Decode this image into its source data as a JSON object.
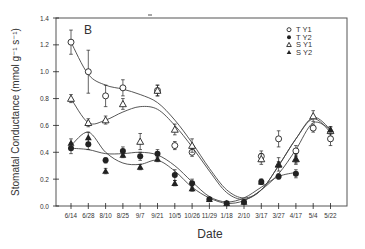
{
  "chart_data": {
    "type": "scatter",
    "panel_label": "B",
    "title": "",
    "xlabel": "Date",
    "ylabel": "Stomatal Conductance (mmol g⁻¹ s⁻¹)",
    "ylim": [
      0.0,
      1.4
    ],
    "yticks": [
      "0.0",
      "0.2",
      "0.4",
      "0.6",
      "0.8",
      "1.0",
      "1.2",
      "1.4"
    ],
    "categories": [
      "6/14",
      "6/28",
      "8/10",
      "8/25",
      "9/7",
      "9/21",
      "10/5",
      "10/26",
      "11/29",
      "1/18",
      "2/10",
      "3/17",
      "3/27",
      "4/17",
      "5/4",
      "5/22"
    ],
    "grid": false,
    "legend_position": "upper right",
    "series": [
      {
        "name": "T Y1",
        "marker": "open-circle",
        "values": [
          1.22,
          1.0,
          0.82,
          0.88,
          null,
          0.86,
          0.45,
          0.4,
          null,
          null,
          null,
          0.37,
          0.5,
          0.41,
          0.58,
          0.5
        ],
        "err": [
          0.09,
          0.16,
          0.08,
          0.06,
          null,
          0.04,
          0.03,
          0.03,
          null,
          null,
          null,
          0.04,
          0.06,
          0.04,
          0.03,
          0.05
        ]
      },
      {
        "name": "T Y2",
        "marker": "filled-circle",
        "values": [
          0.43,
          0.46,
          0.34,
          0.41,
          0.37,
          0.39,
          0.23,
          0.17,
          0.05,
          0.02,
          0.03,
          0.18,
          0.22,
          0.24,
          null,
          null
        ],
        "err": [
          0.04,
          0.04,
          0.02,
          0.03,
          0.03,
          0.03,
          0.04,
          0.03,
          0.01,
          0.01,
          0.01,
          0.02,
          0.02,
          0.03,
          null,
          null
        ]
      },
      {
        "name": "S Y1",
        "marker": "open-triangle",
        "values": [
          0.8,
          0.62,
          0.64,
          0.76,
          0.48,
          0.86,
          0.57,
          0.45,
          null,
          null,
          null,
          0.35,
          0.31,
          0.35,
          0.67,
          0.56
        ],
        "err": [
          0.03,
          0.03,
          0.03,
          0.04,
          0.06,
          0.04,
          0.04,
          0.05,
          null,
          null,
          null,
          0.04,
          0.05,
          0.04,
          0.04,
          0.03
        ]
      },
      {
        "name": "S Y2",
        "marker": "filled-triangle",
        "values": [
          0.47,
          0.51,
          0.26,
          0.38,
          0.29,
          0.35,
          0.17,
          0.13,
          0.05,
          0.02,
          0.03,
          0.18,
          0.31,
          0.35,
          null,
          0.57
        ],
        "err": [
          0.03,
          0.04,
          0.02,
          0.02,
          0.02,
          0.02,
          0.02,
          0.02,
          0.01,
          0.01,
          0.01,
          0.02,
          0.02,
          0.03,
          null,
          0.02
        ]
      }
    ],
    "fit_curves": [
      {
        "name": "T Y1 fit",
        "values": [
          1.22,
          0.98,
          0.9,
          0.87,
          0.83,
          0.77,
          0.64,
          0.47,
          0.28,
          0.12,
          0.06,
          0.12,
          0.3,
          0.5,
          0.65,
          0.55
        ]
      },
      {
        "name": "S Y1 fit",
        "values": [
          0.8,
          0.62,
          0.64,
          0.7,
          0.74,
          0.72,
          0.6,
          0.44,
          0.26,
          0.1,
          0.05,
          0.12,
          0.3,
          0.5,
          0.66,
          0.57
        ]
      },
      {
        "name": "T Y2 fit",
        "values": [
          0.43,
          0.42,
          0.39,
          0.39,
          0.4,
          0.38,
          0.3,
          0.18,
          0.07,
          0.03,
          0.06,
          0.14,
          0.22,
          0.25
        ]
      },
      {
        "name": "S Y2 fit",
        "values": [
          0.45,
          0.55,
          0.4,
          0.32,
          0.31,
          0.34,
          0.26,
          0.14,
          0.06,
          0.02,
          0.04,
          0.12,
          0.24,
          0.42,
          0.62,
          0.57
        ]
      }
    ]
  },
  "legend": {
    "items": [
      {
        "label": "T Y1",
        "marker": "open-circle"
      },
      {
        "label": "T Y2",
        "marker": "filled-circle"
      },
      {
        "label": "S Y1",
        "marker": "open-triangle"
      },
      {
        "label": "S Y2",
        "marker": "filled-triangle"
      }
    ]
  }
}
